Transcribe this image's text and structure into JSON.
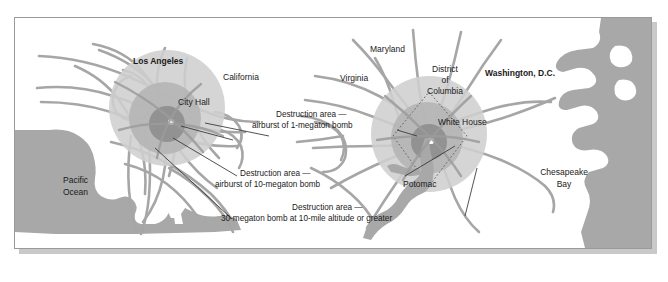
{
  "figure": {
    "type": "map"
  },
  "colors": {
    "water": "#a8a8a8",
    "road": "#a6a6a6",
    "ring_outer": "#cfcfcf",
    "ring_mid": "#b5b5b5",
    "ring_inner": "#8e8e8e",
    "center_dot": "#ffffff",
    "text": "#1a1a1a",
    "frame": "#9a9a9a",
    "shadow": "#c9c9c9",
    "leader": "#333333",
    "boundary": "#6f6f6f"
  },
  "labels": {
    "los_angeles": "Los Angeles",
    "california": "California",
    "city_hall": "City Hall",
    "pacific_ocean_line1": "Pacific",
    "pacific_ocean_line2": "Ocean",
    "maryland": "Maryland",
    "virginia": "Virginia",
    "dc_line1": "District",
    "dc_line2": "of",
    "dc_line3": "Columbia",
    "washington_dc": "Washington, D.C.",
    "white_house": "White House",
    "potomac": "Potomac",
    "chesapeake_line1": "Chesapeake",
    "chesapeake_line2": "Bay"
  },
  "captions": [
    {
      "id": "caption-1-megaton",
      "line1": "Destruction area —",
      "line2": "airburst of 1-megaton bomb"
    },
    {
      "id": "caption-10-megaton",
      "line1": "Destruction area —",
      "line2": "airburst of 10-megaton bomb"
    },
    {
      "id": "caption-30-megaton",
      "line1": "Destruction area —",
      "line2": "30-megaton bomb at 10-mile altitude or greater"
    }
  ]
}
